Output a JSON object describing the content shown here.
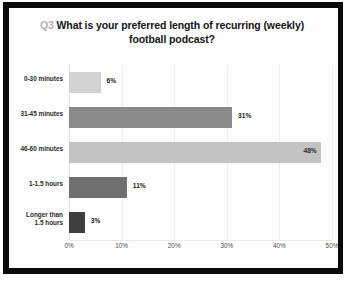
{
  "slide": {
    "title_prefix": "Q3",
    "title_text": "What is your preferred length of recurring (weekly) football podcast?"
  },
  "chart_data": {
    "type": "bar",
    "orientation": "horizontal",
    "title": "Q3 What is your preferred length of recurring (weekly) football podcast?",
    "xlabel": "",
    "ylabel": "",
    "xlim": [
      0,
      50
    ],
    "grid": true,
    "legend": "none",
    "categories": [
      "0-30 minutes",
      "31-45 minutes",
      "46-60 minutes",
      "1-1.5 hours",
      "Longer than\n1.5 hours"
    ],
    "values": [
      6,
      31,
      48,
      11,
      3
    ],
    "value_labels": [
      "6%",
      "31%",
      "48%",
      "11%",
      "3%"
    ],
    "bar_colors": [
      "#d2d2d2",
      "#8a8a8a",
      "#c3c3c3",
      "#6f6f6f",
      "#3f3f3f"
    ],
    "label_inside": [
      false,
      false,
      true,
      false,
      false
    ],
    "tick_values": [
      0,
      10,
      20,
      30,
      40,
      50
    ],
    "tick_labels": [
      "0%",
      "10%",
      "20%",
      "30%",
      "40%",
      "50%"
    ]
  }
}
